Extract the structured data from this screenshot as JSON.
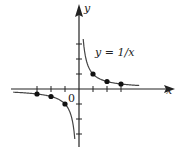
{
  "chart_data": {
    "type": "line",
    "title": "",
    "annotation": "y = 1/x",
    "xlabel": "x",
    "ylabel": "y",
    "origin_label": "0",
    "xlim": [
      -3.5,
      3.5
    ],
    "ylim": [
      -3.5,
      3.5
    ],
    "grid": false,
    "x_ticks": [
      -3,
      -2,
      -1,
      1,
      2,
      3
    ],
    "y_ticks": [
      -3,
      -2,
      -1,
      1,
      2,
      3
    ],
    "series": [
      {
        "name": "y = 1/x",
        "curve": "y = 1/x",
        "points": [
          {
            "x": -3,
            "y": -0.333
          },
          {
            "x": -2,
            "y": -0.5
          },
          {
            "x": -1,
            "y": -1
          },
          {
            "x": 1,
            "y": 1
          },
          {
            "x": 2,
            "y": 0.5
          },
          {
            "x": 3,
            "y": 0.333
          }
        ]
      }
    ],
    "colors": {
      "axis": "#222222",
      "curve": "#444444",
      "points": "#111111"
    }
  }
}
